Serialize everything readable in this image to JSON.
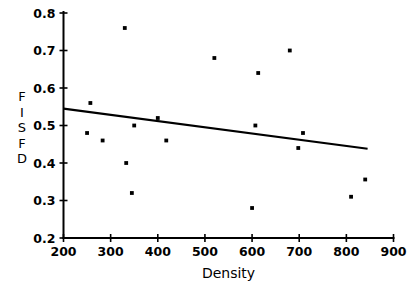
{
  "chart_data": {
    "type": "scatter",
    "title": "",
    "xlabel": "Density",
    "ylabel": "FISFD",
    "ylabel_chars": [
      "F",
      "I",
      "S",
      "F",
      "D"
    ],
    "xlim": [
      200,
      900
    ],
    "ylim": [
      0.2,
      0.8
    ],
    "xticks": [
      200,
      300,
      400,
      500,
      600,
      700,
      800,
      900
    ],
    "xtick_labels": [
      "200",
      "300",
      "400",
      "500",
      "600",
      "700",
      "800",
      "900"
    ],
    "yticks": [
      0.2,
      0.3,
      0.4,
      0.5,
      0.6,
      0.7,
      0.8
    ],
    "ytick_labels": [
      "0.2",
      "0.3",
      "0.4",
      "0.5",
      "0.6",
      "0.7",
      "0.8"
    ],
    "grid": false,
    "legend": false,
    "marker": "square",
    "marker_color": "#000000",
    "points": [
      {
        "x": 250,
        "y": 0.48
      },
      {
        "x": 257,
        "y": 0.56
      },
      {
        "x": 283,
        "y": 0.46
      },
      {
        "x": 330,
        "y": 0.76
      },
      {
        "x": 333,
        "y": 0.4
      },
      {
        "x": 345,
        "y": 0.32
      },
      {
        "x": 350,
        "y": 0.5
      },
      {
        "x": 400,
        "y": 0.52
      },
      {
        "x": 418,
        "y": 0.46
      },
      {
        "x": 520,
        "y": 0.68
      },
      {
        "x": 600,
        "y": 0.28
      },
      {
        "x": 607,
        "y": 0.5
      },
      {
        "x": 613,
        "y": 0.64
      },
      {
        "x": 680,
        "y": 0.7
      },
      {
        "x": 698,
        "y": 0.44
      },
      {
        "x": 708,
        "y": 0.48
      },
      {
        "x": 810,
        "y": 0.31
      },
      {
        "x": 840,
        "y": 0.356
      }
    ],
    "fit_line": {
      "label": "least-squares fit",
      "x_start": 200,
      "y_start": 0.545,
      "x_end": 845,
      "y_end": 0.438
    }
  }
}
